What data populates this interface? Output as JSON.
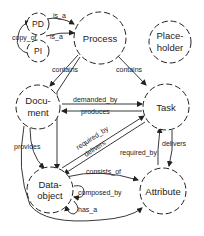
{
  "diagram": {
    "nodes": {
      "pd": {
        "label": "PD"
      },
      "pi": {
        "label": "PI"
      },
      "process": {
        "label": "Process"
      },
      "placeholder": {
        "line1": "Place-",
        "line2": "holder"
      },
      "document": {
        "line1": "Docu-",
        "line2": "ment"
      },
      "task": {
        "label": "Task"
      },
      "dataobject": {
        "line1": "Data-",
        "line2": "object"
      },
      "attribute": {
        "label": "Attribute"
      }
    },
    "edges": {
      "pd_is_a": "is_a",
      "pi_is_a": "is_a",
      "copy_of": "copy_of",
      "process_contains_document": "contains",
      "process_contains_task": "contains",
      "demanded_by": "demanded_by",
      "produces": "produces",
      "required_by_do_task": "required_by",
      "delivers_task_do": "delivers",
      "provides": "provides",
      "required_by_attr_task": "required_by",
      "delivers_task_attr": "delivers",
      "consists_of": "consists_of",
      "composed_by": "composed_by",
      "has_a": "has_a"
    }
  }
}
